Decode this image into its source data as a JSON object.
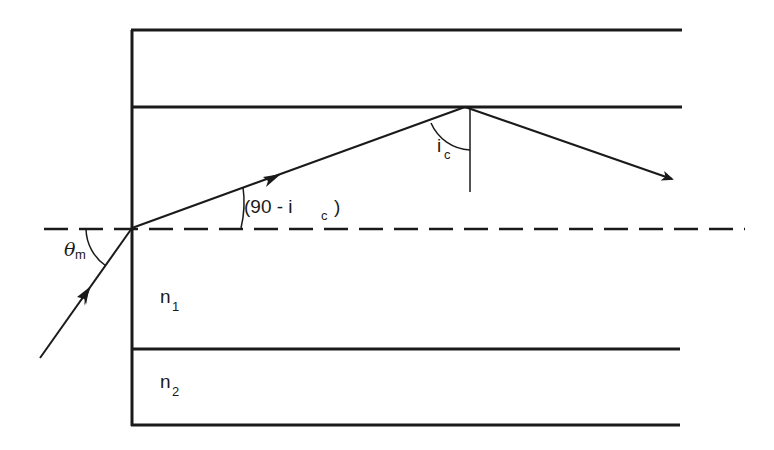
{
  "diagram": {
    "type": "optical-fiber-total-internal-reflection",
    "labels": {
      "acceptance_angle": {
        "symbol": "θ",
        "subscript": "m"
      },
      "refraction_angle": {
        "prefix": "(90 - i",
        "subscript": "c",
        "suffix": ")"
      },
      "critical_angle": {
        "symbol": "i",
        "subscript": "c"
      },
      "core_index": {
        "symbol": "n",
        "subscript": "1"
      },
      "cladding_index": {
        "symbol": "n",
        "subscript": "2"
      }
    },
    "colors": {
      "stroke": "#1a1a1a",
      "background": "#ffffff"
    },
    "elements": [
      "outer cladding boundary (top)",
      "core-cladding interface (top)",
      "fiber axis (dashed)",
      "core-cladding interface (bottom)",
      "outer cladding boundary (bottom)",
      "fiber end face",
      "incident ray",
      "refracted ray",
      "totally reflected ray",
      "normal at reflection point"
    ]
  }
}
